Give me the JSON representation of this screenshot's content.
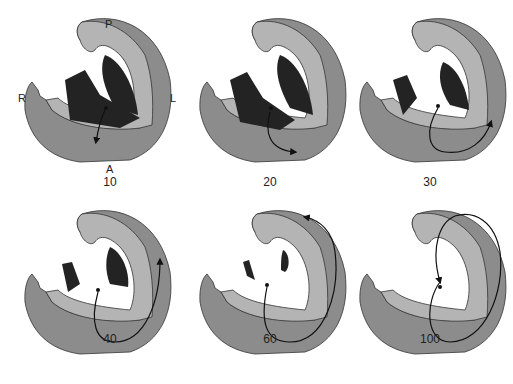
{
  "figure": {
    "orientation_labels": {
      "posterior": "P",
      "right": "R",
      "left": "L",
      "anterior": "A"
    },
    "colors": {
      "outer_wall": "#8c8c8c",
      "inner_wall": "#b4b4b4",
      "dark_region": "#232323",
      "background": "#ffffff",
      "outline": "#333333"
    },
    "panels": [
      {
        "label": "10",
        "dark": "large",
        "arrow": "short-down"
      },
      {
        "label": "20",
        "dark": "large",
        "arrow": "down-right"
      },
      {
        "label": "30",
        "dark": "medium",
        "arrow": "loop-right-up"
      },
      {
        "label": "40",
        "dark": "small",
        "arrow": "loop-up-left-wall"
      },
      {
        "label": "60",
        "dark": "trace",
        "arrow": "loop-up-top"
      },
      {
        "label": "100",
        "dark": "none",
        "arrow": "full-loop"
      }
    ]
  }
}
